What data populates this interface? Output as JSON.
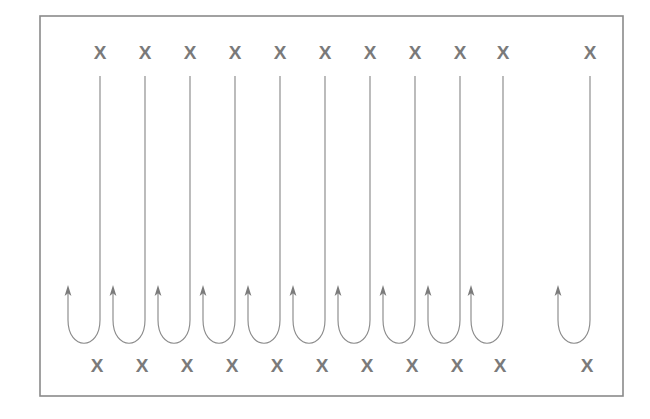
{
  "figure": {
    "title": "Serpentine boustrophedon path over a field of X markers",
    "canvas": {
      "width": 650,
      "height": 419,
      "background": "#ffffff"
    },
    "frame": {
      "name": "outer-border",
      "x": 40,
      "y": 16,
      "width": 583,
      "height": 380,
      "stroke_color": "#8a8a8a",
      "stroke_width": 1.6,
      "fill_color": "#ffffff"
    },
    "colors": {
      "line": "#8b8b8b",
      "arrow": "#7b7b7b",
      "marker": "#7a7a7a",
      "border": "#8a8a8a",
      "background": "#ffffff"
    }
  },
  "markers": {
    "glyph": "X",
    "count_top": 11,
    "count_bottom": 11,
    "font_size": 19,
    "color": "#7a7a7a",
    "top_row": {
      "name": "top-marker-row",
      "y": 52,
      "x_positions": [
        100,
        145,
        190,
        235,
        280,
        325,
        370,
        415,
        460,
        503,
        590
      ],
      "labels": [
        "X",
        "X",
        "X",
        "X",
        "X",
        "X",
        "X",
        "X",
        "X",
        "X",
        "X"
      ]
    },
    "bottom_row": {
      "name": "bottom-marker-row",
      "y": 365,
      "x_positions": [
        97,
        142,
        187,
        232,
        277,
        322,
        367,
        412,
        457,
        500,
        587
      ],
      "labels": [
        "X",
        "X",
        "X",
        "X",
        "X",
        "X",
        "X",
        "X",
        "X",
        "X",
        "X"
      ]
    }
  },
  "paths": {
    "count": 11,
    "description": "Eleven U-turn (hairpin) path segments; each has a left branch terminating in an upward arrow and a right branch running up to the top of the frame.",
    "top_y": 76,
    "arrow_tip_y": 285,
    "turn_top_y": 320,
    "turn_bottom_y": 347,
    "u_half_width": 16,
    "segments": [
      {
        "id": 1,
        "left_x": 68,
        "right_x": 100,
        "arrow": "up"
      },
      {
        "id": 2,
        "left_x": 113,
        "right_x": 145,
        "arrow": "up"
      },
      {
        "id": 3,
        "left_x": 158,
        "right_x": 190,
        "arrow": "up"
      },
      {
        "id": 4,
        "left_x": 203,
        "right_x": 235,
        "arrow": "up"
      },
      {
        "id": 5,
        "left_x": 248,
        "right_x": 280,
        "arrow": "up"
      },
      {
        "id": 6,
        "left_x": 293,
        "right_x": 325,
        "arrow": "up"
      },
      {
        "id": 7,
        "left_x": 338,
        "right_x": 370,
        "arrow": "up"
      },
      {
        "id": 8,
        "left_x": 383,
        "right_x": 415,
        "arrow": "up"
      },
      {
        "id": 9,
        "left_x": 428,
        "right_x": 460,
        "arrow": "up"
      },
      {
        "id": 10,
        "left_x": 471,
        "right_x": 503,
        "arrow": "up"
      },
      {
        "id": 11,
        "left_x": 558,
        "right_x": 590,
        "arrow": "up"
      }
    ]
  },
  "chart_data": {
    "type": "diagram",
    "title": "Serpentine boustrophedon path over a field of X markers",
    "xlabel": "",
    "ylabel": "",
    "legend": [],
    "annotations": [],
    "series": [
      {
        "name": "top-x-markers",
        "marker": "X",
        "x": [
          100,
          145,
          190,
          235,
          280,
          325,
          370,
          415,
          460,
          503,
          590
        ],
        "y": [
          52,
          52,
          52,
          52,
          52,
          52,
          52,
          52,
          52,
          52,
          52
        ]
      },
      {
        "name": "bottom-x-markers",
        "marker": "X",
        "x": [
          97,
          142,
          187,
          232,
          277,
          322,
          367,
          412,
          457,
          500,
          587
        ],
        "y": [
          365,
          365,
          365,
          365,
          365,
          365,
          365,
          365,
          365,
          365,
          365
        ]
      },
      {
        "name": "hairpin-paths",
        "marker": "line-with-arrow",
        "x": [
          68,
          113,
          158,
          203,
          248,
          293,
          338,
          383,
          428,
          471,
          558
        ],
        "y": [
          285,
          285,
          285,
          285,
          285,
          285,
          285,
          285,
          285,
          285,
          285
        ]
      }
    ]
  }
}
